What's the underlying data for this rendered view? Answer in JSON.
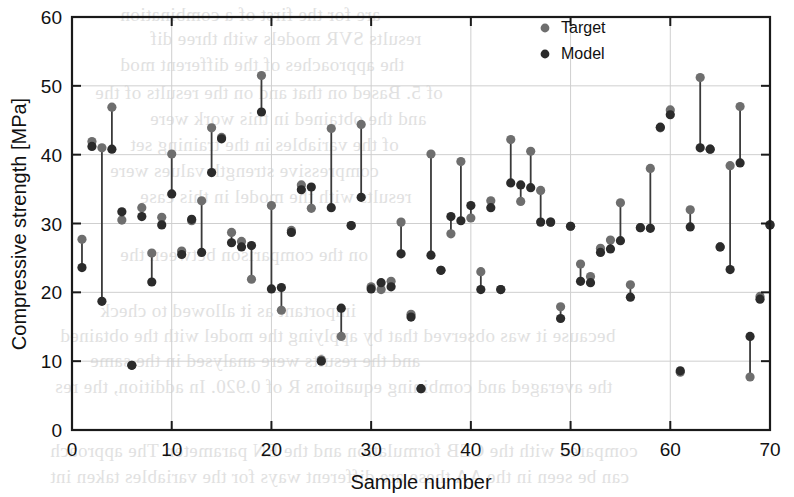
{
  "figure": {
    "background_color": "#ffffff",
    "axis_color": "#1a1a1a",
    "grid_color": "#cfcfcf"
  },
  "legend": {
    "position": "top-right-inside",
    "entries": [
      {
        "label": "Target",
        "color": "#6e6e6e",
        "marker": "circle"
      },
      {
        "label": "Model",
        "color": "#2b2b2b",
        "marker": "circle"
      }
    ]
  },
  "bleed_text": [
    {
      "text": "are for the first of a combination",
      "x": 120,
      "y": 4
    },
    {
      "text": "results SVR models with three dif",
      "x": 150,
      "y": 28
    },
    {
      "text": "the approaches of the different mod",
      "x": 120,
      "y": 54
    },
    {
      "text": "of 5. Based on that and on the results of the",
      "x": 95,
      "y": 82
    },
    {
      "text": "and the obtained in this work were",
      "x": 150,
      "y": 108
    },
    {
      "text": "of the variables in the training set",
      "x": 130,
      "y": 134
    },
    {
      "text": "compressive strength values were",
      "x": 110,
      "y": 160
    },
    {
      "text": "results with the model in this case",
      "x": 140,
      "y": 186
    },
    {
      "text": "on the comparison between the",
      "x": 120,
      "y": 244
    },
    {
      "text": "important as it allowed to check",
      "x": 100,
      "y": 300
    },
    {
      "text": "because it was observed that by applying the model with the obtained",
      "x": 60,
      "y": 325
    },
    {
      "text": "and the results were analysed in the same",
      "x": 90,
      "y": 350
    },
    {
      "text": "the averaged and combining equations R of 0.920. In addition, the res",
      "x": 55,
      "y": 376
    },
    {
      "text": "compared with the CEB formulation and the EN parameter. The approach",
      "x": 50,
      "y": 440
    },
    {
      "text": "can be seen in the AA these are different ways for the variables taken int",
      "x": 50,
      "y": 466
    }
  ],
  "chart_data": {
    "type": "scatter",
    "title": "",
    "xlabel": "Sample number",
    "ylabel": "Compressive strength [MPa]",
    "xlim": [
      0,
      70
    ],
    "ylim": [
      0,
      60
    ],
    "xticks": [
      0,
      10,
      20,
      30,
      40,
      50,
      60,
      70
    ],
    "yticks": [
      0,
      10,
      20,
      30,
      40,
      50,
      60
    ],
    "grid": true,
    "connectors": true,
    "series": [
      {
        "name": "Target",
        "color": "#6e6e6e"
      },
      {
        "name": "Model",
        "color": "#2b2b2b"
      }
    ],
    "x": [
      1,
      2,
      3,
      4,
      5,
      6,
      7,
      8,
      9,
      10,
      11,
      12,
      13,
      14,
      15,
      16,
      17,
      18,
      19,
      20,
      21,
      22,
      23,
      24,
      25,
      26,
      27,
      28,
      29,
      30,
      31,
      32,
      33,
      34,
      35,
      36,
      37,
      38,
      39,
      40,
      41,
      42,
      43,
      44,
      45,
      46,
      47,
      48,
      49,
      50,
      51,
      52,
      53,
      54,
      55,
      56,
      57,
      58,
      59,
      60,
      61,
      62,
      63,
      64,
      65,
      66,
      67,
      68,
      69,
      70
    ],
    "target": [
      27.7,
      41.9,
      41.0,
      46.9,
      30.5,
      9.4,
      32.3,
      25.7,
      30.9,
      40.1,
      26.0,
      30.4,
      33.3,
      43.9,
      42.5,
      28.7,
      27.4,
      21.9,
      51.5,
      32.6,
      17.4,
      29.0,
      35.6,
      32.2,
      10.2,
      43.8,
      13.6,
      29.7,
      44.4,
      20.8,
      20.4,
      21.6,
      30.2,
      16.8,
      6.0,
      40.1,
      23.2,
      28.5,
      39.0,
      30.8,
      23.0,
      33.3,
      20.4,
      42.2,
      33.2,
      40.5,
      34.8,
      30.2,
      17.9,
      29.6,
      24.1,
      22.3,
      26.4,
      27.6,
      33.0,
      21.1,
      29.4,
      38.0,
      43.9,
      46.5,
      8.4,
      32.0,
      51.2,
      40.8,
      26.6,
      38.4,
      47.0,
      7.7,
      19.4,
      29.8
    ],
    "model": [
      23.6,
      41.2,
      18.7,
      40.8,
      31.7,
      9.4,
      31.0,
      21.5,
      29.8,
      34.3,
      25.5,
      30.6,
      25.8,
      37.4,
      42.3,
      27.2,
      26.6,
      26.8,
      46.2,
      20.5,
      20.7,
      28.7,
      34.9,
      35.3,
      10.0,
      32.3,
      17.7,
      29.7,
      33.8,
      20.5,
      21.4,
      20.8,
      25.6,
      16.4,
      6.0,
      25.4,
      23.2,
      31.0,
      30.4,
      32.6,
      20.4,
      32.3,
      20.4,
      35.9,
      35.6,
      35.2,
      30.2,
      30.2,
      16.2,
      29.6,
      21.6,
      21.4,
      25.8,
      26.3,
      27.5,
      19.3,
      29.4,
      29.3,
      44.0,
      45.8,
      8.6,
      29.5,
      41.0,
      40.8,
      26.6,
      23.3,
      38.8,
      13.6,
      19.0,
      29.8
    ]
  }
}
